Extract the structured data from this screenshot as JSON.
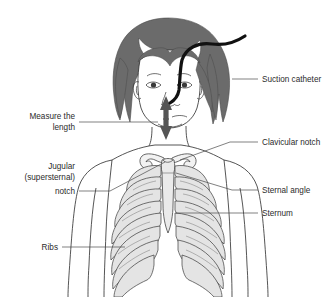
{
  "figure": {
    "background_color": "#ffffff"
  },
  "colors": {
    "hair": "#6b6b6b",
    "hair_dark": "#5a5a5a",
    "skin": "#ffffff",
    "outline": "#1a1a1a",
    "catheter": "#111111",
    "arrow": "#555555",
    "bone_fill": "#e4e4e4",
    "sternum_fill": "#eaeaea",
    "label_text": "#2b2b2b",
    "leader_line": "#4a4a4a"
  },
  "labels": {
    "suction_catheter": {
      "lines": [
        "Suction catheter"
      ],
      "side": "right"
    },
    "clavicular_notch": {
      "lines": [
        "Clavicular notch"
      ],
      "side": "right"
    },
    "sternal_angle": {
      "lines": [
        "Sternal angle"
      ],
      "side": "right"
    },
    "sternum": {
      "lines": [
        "Sternum"
      ],
      "side": "right"
    },
    "measure_the_length": {
      "lines": [
        "Measure the",
        "length"
      ],
      "side": "left"
    },
    "jugular_notch": {
      "lines": [
        "Jugular",
        "(supersternal)",
        "notch"
      ],
      "side": "left"
    },
    "ribs": {
      "lines": [
        "Ribs"
      ],
      "side": "left"
    }
  },
  "anatomy": {
    "parts": [
      "hair",
      "face",
      "neck",
      "shoulders",
      "arms",
      "clavicles",
      "sternum",
      "ribs",
      "xiphoid-process"
    ],
    "rib_pair_count": 10
  },
  "devices": {
    "catheter": {
      "name": "suction-catheter",
      "description": "black flexible tube entering nostril and curving to upper right"
    },
    "measurement_arrow": {
      "name": "double-headed-measure-arrow",
      "description": "vertical double-headed arrow from nose to jaw"
    }
  }
}
